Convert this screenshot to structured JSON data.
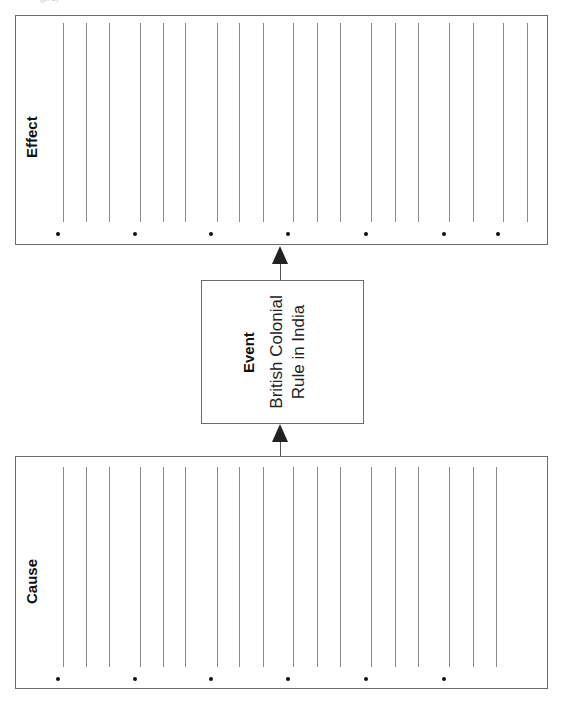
{
  "page": {
    "orientation": "rotated-90-ccw",
    "top_cropped_text": "(p. 2)"
  },
  "effect": {
    "label": "Effect",
    "rule_x": [
      63,
      86,
      109,
      140,
      163,
      185,
      217,
      239,
      263,
      293,
      317,
      340,
      371,
      395,
      418,
      449,
      473,
      503,
      527
    ],
    "bullet_x": [
      58,
      135,
      211,
      288,
      366,
      444,
      498
    ]
  },
  "event": {
    "label": "Event",
    "text_line1": "British Colonial",
    "text_line2": "Rule in India"
  },
  "cause": {
    "label": "Cause",
    "rule_x": [
      63,
      86,
      109,
      140,
      163,
      185,
      217,
      239,
      263,
      293,
      317,
      340,
      371,
      395,
      418,
      449,
      473,
      496
    ],
    "bullet_x": [
      58,
      135,
      211,
      288,
      366,
      444
    ]
  },
  "colors": {
    "border": "#6b6b6b",
    "rule": "#8a8a8a",
    "text": "#111111",
    "arrow": "#222222"
  }
}
